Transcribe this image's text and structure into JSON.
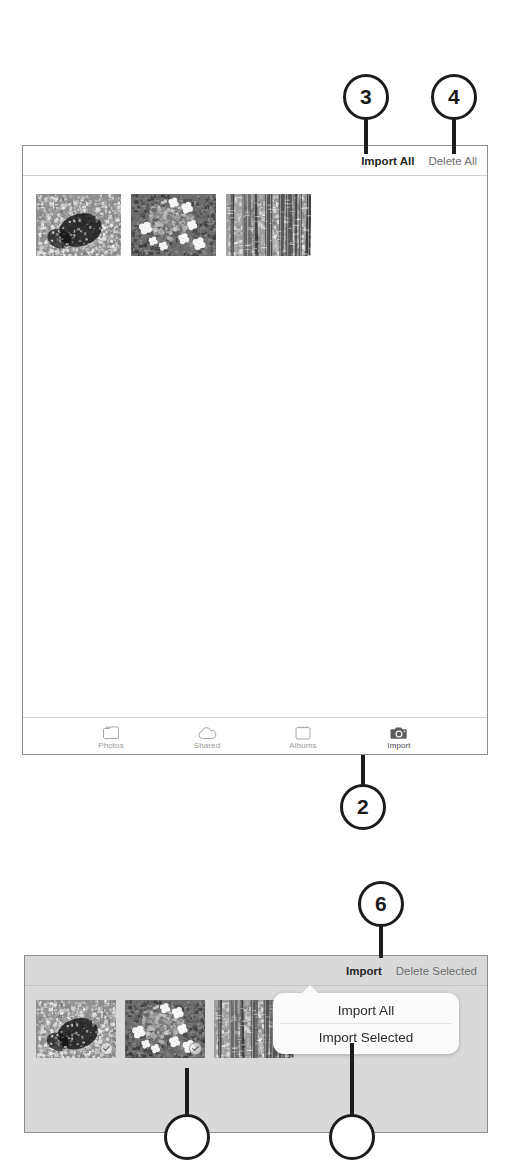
{
  "figure": {
    "callouts": [
      {
        "id": "callout-3",
        "number": "3"
      },
      {
        "id": "callout-4",
        "number": "4"
      },
      {
        "id": "callout-2",
        "number": "2"
      },
      {
        "id": "callout-6",
        "number": "6"
      }
    ]
  },
  "panel_top": {
    "header": {
      "import_all_label": "Import All",
      "delete_all_label": "Delete All"
    },
    "photos": [
      {
        "alt": "rocky-stream-foliage-photo",
        "selected": false
      },
      {
        "alt": "hydrangea-flowers-photo",
        "selected": false
      },
      {
        "alt": "birch-trees-photo",
        "selected": false
      }
    ],
    "tabbar": [
      {
        "label": "Photos",
        "icon": "photos-icon",
        "active": false
      },
      {
        "label": "Shared",
        "icon": "cloud-icon",
        "active": false
      },
      {
        "label": "Albums",
        "icon": "albums-icon",
        "active": false
      },
      {
        "label": "Import",
        "icon": "camera-icon",
        "active": true
      }
    ]
  },
  "panel_bottom": {
    "header": {
      "import_label": "Import",
      "delete_selected_label": "Delete Selected"
    },
    "photos": [
      {
        "alt": "rocky-stream-foliage-photo",
        "selected": true
      },
      {
        "alt": "hydrangea-flowers-photo",
        "selected": true
      },
      {
        "alt": "birch-trees-photo",
        "selected": false
      }
    ],
    "popover": {
      "items": [
        {
          "label": "Import All"
        },
        {
          "label": "Import Selected"
        }
      ]
    }
  },
  "colors": {
    "ink": "#1c1c1c",
    "panel_border": "#8d8d8d",
    "panel_gray_bg": "#d9d9d9",
    "muted_text": "#6e6e6e",
    "tab_inactive": "#9a9a9a"
  }
}
